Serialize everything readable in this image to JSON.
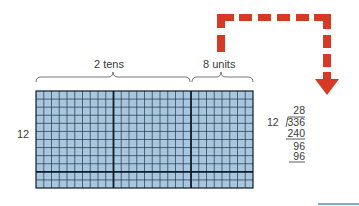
{
  "diagram": {
    "labels": {
      "tens": "2 tens",
      "units": "8 units",
      "rows": "12"
    },
    "grid": {
      "rows": 12,
      "cols": 28,
      "tens_blocks": 2,
      "units_cols": 8,
      "thick_row_after": 10,
      "fill_color": "#a9c6df",
      "line_color": "#1a2a3a"
    },
    "arrow": {
      "color": "#d63a27",
      "style": "dashed"
    },
    "long_division": {
      "quotient": "28",
      "divisor": "12",
      "dividend": "336",
      "step1": "240",
      "remainder1": "96",
      "step2": "96"
    },
    "accent_line_color": "#4a90c8"
  }
}
